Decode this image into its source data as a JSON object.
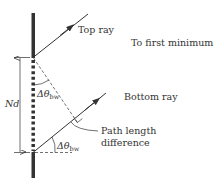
{
  "labels": {
    "top_ray": "Top ray",
    "to_first_minimum": "To first minimum",
    "bottom_ray": "Bottom ray",
    "path_length_line1": "Path length",
    "path_length_line2": "difference",
    "nd": "Nd",
    "angle_symbol": "Δθ",
    "angle_subscript": "bw"
  },
  "colors": {
    "ink": "#333333",
    "background": "#ffffff"
  }
}
